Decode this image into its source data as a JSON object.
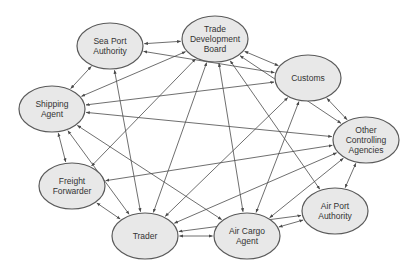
{
  "diagram": {
    "type": "network",
    "directed": true,
    "nodes": [
      {
        "id": "sea_port",
        "lines": [
          "Sea Port",
          "Authority"
        ],
        "cx": 110,
        "cy": 46
      },
      {
        "id": "tdb",
        "lines": [
          "Trade",
          "Development",
          "Board"
        ],
        "cx": 215,
        "cy": 39
      },
      {
        "id": "customs",
        "lines": [
          "Customs"
        ],
        "cx": 308,
        "cy": 78
      },
      {
        "id": "shipping",
        "lines": [
          "Shipping",
          "Agent"
        ],
        "cx": 52,
        "cy": 109
      },
      {
        "id": "other",
        "lines": [
          "Other",
          "Controlling",
          "Agencies"
        ],
        "cx": 366,
        "cy": 140
      },
      {
        "id": "freight",
        "lines": [
          "Freight",
          "Forwarder"
        ],
        "cx": 72,
        "cy": 186
      },
      {
        "id": "airport",
        "lines": [
          "Air Port",
          "Authority"
        ],
        "cx": 335,
        "cy": 211
      },
      {
        "id": "trader",
        "lines": [
          "Trader"
        ],
        "cx": 145,
        "cy": 236
      },
      {
        "id": "aircargo",
        "lines": [
          "Air Cargo",
          "Agent"
        ],
        "cx": 247,
        "cy": 236
      }
    ],
    "edges": [
      {
        "from": "sea_port",
        "to": "tdb",
        "bidirectional": true
      },
      {
        "from": "tdb",
        "to": "customs",
        "bidirectional": true
      },
      {
        "from": "customs",
        "to": "other",
        "bidirectional": true
      },
      {
        "from": "other",
        "to": "airport",
        "bidirectional": true
      },
      {
        "from": "airport",
        "to": "aircargo",
        "bidirectional": true
      },
      {
        "from": "aircargo",
        "to": "trader",
        "bidirectional": true
      },
      {
        "from": "trader",
        "to": "freight",
        "bidirectional": true
      },
      {
        "from": "freight",
        "to": "shipping",
        "bidirectional": true
      },
      {
        "from": "shipping",
        "to": "sea_port",
        "bidirectional": true
      },
      {
        "from": "tdb",
        "to": "shipping",
        "bidirectional": true
      },
      {
        "from": "customs",
        "to": "sea_port",
        "bidirectional": true
      },
      {
        "from": "customs",
        "to": "shipping",
        "bidirectional": true
      },
      {
        "from": "other",
        "to": "shipping",
        "bidirectional": true
      },
      {
        "from": "other",
        "to": "freight",
        "bidirectional": true
      },
      {
        "from": "other",
        "to": "trader",
        "bidirectional": true
      },
      {
        "from": "other",
        "to": "aircargo",
        "bidirectional": true
      },
      {
        "from": "sea_port",
        "to": "trader",
        "bidirectional": true
      },
      {
        "from": "tdb",
        "to": "freight",
        "bidirectional": true
      },
      {
        "from": "tdb",
        "to": "trader",
        "bidirectional": true
      },
      {
        "from": "tdb",
        "to": "aircargo",
        "bidirectional": true
      },
      {
        "from": "tdb",
        "to": "airport",
        "bidirectional": true
      },
      {
        "from": "tdb",
        "to": "other",
        "bidirectional": true
      },
      {
        "from": "customs",
        "to": "trader",
        "bidirectional": true
      },
      {
        "from": "customs",
        "to": "aircargo",
        "bidirectional": true
      },
      {
        "from": "shipping",
        "to": "trader",
        "bidirectional": true
      },
      {
        "from": "shipping",
        "to": "aircargo",
        "bidirectional": true
      },
      {
        "from": "airport",
        "to": "trader",
        "bidirectional": true
      }
    ],
    "colors": {
      "node_fill": "#e8e8e8",
      "node_stroke": "#5a5a5a",
      "edge": "#4a4a4a",
      "text": "#333333"
    }
  }
}
